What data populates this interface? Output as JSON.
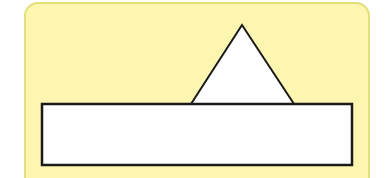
{
  "canvas": {
    "width": 387,
    "height": 178
  },
  "colors": {
    "background": "#ffffff",
    "card_fill": "#fcf6b0",
    "card_border": "#e3e07a",
    "shape_fill": "#ffffff",
    "shape_stroke": "#1a1a1a"
  },
  "shapes": {
    "triangle": {
      "apex": [
        242,
        25
      ],
      "base_left": [
        191,
        104
      ],
      "base_right": [
        294,
        104
      ]
    },
    "rectangle": {
      "x": 42,
      "y": 104,
      "width": 310,
      "height": 61
    }
  }
}
